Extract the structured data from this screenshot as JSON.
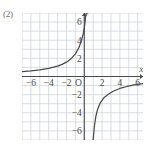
{
  "figure": {
    "item_label": "(2)",
    "background_color": "#ffffff",
    "grid_color": "#c9cfd8",
    "axis_color": "#4a4a4a",
    "curve_color": "#4a4a4a"
  },
  "chart_data": {
    "type": "line",
    "title": "",
    "subtitle": "",
    "xlabel": "x",
    "ylabel": "y",
    "xlim": [
      -7,
      6.6
    ],
    "ylim": [
      -7,
      7
    ],
    "grid": true,
    "grid_step": 1,
    "legend": null,
    "origin_label": "O",
    "x_ticks": [
      -6,
      -4,
      -2,
      2,
      4,
      6
    ],
    "x_tick_labels": [
      "−6",
      "−4",
      "−2",
      "2",
      "4",
      "6"
    ],
    "y_ticks": [
      -6,
      -4,
      -2,
      2,
      4,
      6
    ],
    "y_tick_labels": [
      "−6",
      "−4",
      "−2",
      "2",
      "4",
      "6"
    ],
    "annotations": [
      {
        "text": "x",
        "x": 6.4,
        "y": 0.55
      },
      {
        "text": "y",
        "x": 0.35,
        "y": 6.9
      }
    ],
    "series": [
      {
        "name": "upper-left branch",
        "description": "hyperbola branch rising from lower-left to vertical asymptote near x = 0.6",
        "vertical_asymptote": 0.6,
        "horizontal_asymptote": 0,
        "points": [
          {
            "x": -7.0,
            "y": 0.55
          },
          {
            "x": -6.0,
            "y": 0.62
          },
          {
            "x": -5.0,
            "y": 0.73
          },
          {
            "x": -4.0,
            "y": 0.89
          },
          {
            "x": -3.0,
            "y": 1.15
          },
          {
            "x": -2.5,
            "y": 1.33
          },
          {
            "x": -2.0,
            "y": 1.58
          },
          {
            "x": -1.5,
            "y": 1.95
          },
          {
            "x": -1.0,
            "y": 2.5
          },
          {
            "x": -0.6,
            "y": 3.2
          },
          {
            "x": -0.3,
            "y": 4.0
          },
          {
            "x": -0.1,
            "y": 4.8
          },
          {
            "x": 0.05,
            "y": 5.7
          },
          {
            "x": 0.15,
            "y": 6.6
          },
          {
            "x": 0.22,
            "y": 7.0
          }
        ]
      },
      {
        "name": "lower-right branch",
        "description": "hyperbola branch rising from vertical asymptote near x = 0.8 toward horizontal asymptote y = 0",
        "vertical_asymptote": 0.8,
        "horizontal_asymptote": 0,
        "points": [
          {
            "x": 1.0,
            "y": -7.0
          },
          {
            "x": 1.05,
            "y": -6.4
          },
          {
            "x": 1.15,
            "y": -5.4
          },
          {
            "x": 1.3,
            "y": -4.4
          },
          {
            "x": 1.5,
            "y": -3.6
          },
          {
            "x": 1.8,
            "y": -2.9
          },
          {
            "x": 2.2,
            "y": -2.35
          },
          {
            "x": 2.7,
            "y": -1.95
          },
          {
            "x": 3.3,
            "y": -1.6
          },
          {
            "x": 4.0,
            "y": -1.32
          },
          {
            "x": 4.8,
            "y": -1.1
          },
          {
            "x": 5.6,
            "y": -0.92
          },
          {
            "x": 6.6,
            "y": -0.78
          }
        ]
      }
    ]
  }
}
